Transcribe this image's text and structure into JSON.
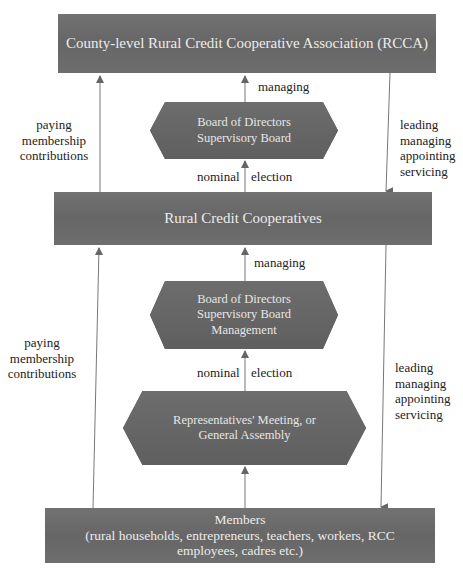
{
  "diagram": {
    "boxes": {
      "rcca": "County-level Rural Credit Cooperative Association (RCCA)",
      "rcc": "Rural Credit Cooperatives",
      "members_title": "Members",
      "members_line2": "(rural households, entrepreneurs, teachers, workers, RCC",
      "members_line3": "employees, cadres etc.)"
    },
    "hexagons": {
      "board_upper": [
        "Board of Directors",
        "Supervisory Board"
      ],
      "board_lower": [
        "Board of Directors",
        "Supervisory Board",
        "Management"
      ],
      "assembly": [
        "Representatives' Meeting, or",
        "General Assembly"
      ]
    },
    "edge_labels": {
      "managing_top": "managing",
      "managing_mid": "managing",
      "nominal_upper": "nominal",
      "election_upper": "election",
      "nominal_lower": "nominal",
      "election_lower": "election",
      "paying_upper": [
        "paying",
        "membership",
        "contributions"
      ],
      "paying_lower": [
        "paying",
        "membership",
        "contributions"
      ],
      "leading_upper": [
        "leading",
        "managing",
        "appointing",
        "servicing"
      ],
      "leading_lower": [
        "leading",
        "managing",
        "appointing",
        "servicing"
      ]
    },
    "colors": {
      "box_fill": "#6a6a6a",
      "box_text": "#ececec",
      "arrow": "#666666",
      "label_text": "#222222"
    }
  }
}
